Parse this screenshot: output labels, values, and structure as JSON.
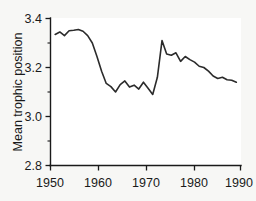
{
  "figure": {
    "background_color": "#f7f7f5",
    "plot_background_color": "#ffffff",
    "line_color": "#2b2b2b",
    "axis_color": "#1a1a1a"
  },
  "chart_data": {
    "type": "line",
    "title": "",
    "subtitle": "",
    "xlabel": "",
    "ylabel": "Mean trophic position",
    "xlim": [
      1950,
      1991
    ],
    "ylim": [
      2.8,
      3.4
    ],
    "xticks": [
      1950,
      1960,
      1970,
      1980,
      1990
    ],
    "xtick_labels": [
      "1950",
      "1960",
      "1970",
      "1980",
      "1990"
    ],
    "yticks": [
      2.8,
      3.0,
      3.2,
      3.4
    ],
    "ytick_labels": [
      "2.8",
      "3.0",
      "3.2",
      "3.4"
    ],
    "yminor_ticks": [
      2.9,
      3.1,
      3.3
    ],
    "xminor_ticks": [
      1955,
      1965,
      1975,
      1985
    ],
    "grid": false,
    "legend": null,
    "series": [
      {
        "name": "Mean trophic position",
        "x": [
          1951,
          1952,
          1953,
          1954,
          1955,
          1956,
          1957,
          1958,
          1959,
          1960,
          1961,
          1962,
          1963,
          1964,
          1965,
          1966,
          1967,
          1968,
          1969,
          1970,
          1971,
          1972,
          1973,
          1974,
          1975,
          1976,
          1977,
          1978,
          1979,
          1980,
          1981,
          1982,
          1983,
          1984,
          1985,
          1986,
          1987,
          1988,
          1989,
          1990
        ],
        "values": [
          3.335,
          3.345,
          3.33,
          3.35,
          3.352,
          3.355,
          3.348,
          3.33,
          3.3,
          3.245,
          3.185,
          3.135,
          3.122,
          3.1,
          3.13,
          3.145,
          3.12,
          3.128,
          3.112,
          3.14,
          3.115,
          3.09,
          3.16,
          3.31,
          3.255,
          3.25,
          3.26,
          3.225,
          3.245,
          3.232,
          3.222,
          3.205,
          3.2,
          3.185,
          3.165,
          3.155,
          3.16,
          3.15,
          3.148,
          3.14
        ]
      }
    ],
    "annotations": []
  }
}
